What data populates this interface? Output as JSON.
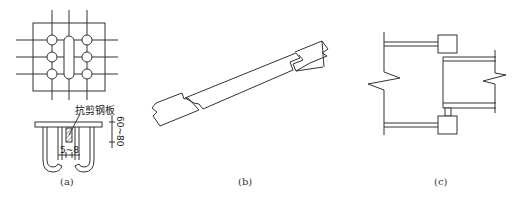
{
  "figure": {
    "panels": [
      {
        "id": "a",
        "label": "(a)",
        "annotation": "抗剪钢板",
        "dim_gap": "5~8",
        "dim_height": "60~80"
      },
      {
        "id": "b",
        "label": "(b)"
      },
      {
        "id": "c",
        "label": "(c)"
      }
    ],
    "stroke_color": "#333333",
    "hatch_color": "#555555"
  }
}
